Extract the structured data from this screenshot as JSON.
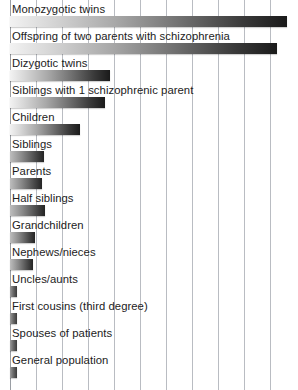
{
  "chart_data": {
    "type": "bar",
    "orientation": "horizontal",
    "title": "",
    "subtitle": "",
    "xlabel": "",
    "ylabel": "",
    "xlim": [
      0,
      50
    ],
    "grid": true,
    "legend": null,
    "gridline_step": 5,
    "gridline_count": 11,
    "categories": [
      "Monozygotic twins",
      "Offspring of two parents with schizophrenia",
      "Dizygotic twins",
      "Siblings with 1 schizophrenic parent",
      "Children",
      "Siblings",
      "Parents",
      "Half siblings",
      "Grandchildren",
      "Nephews/nieces",
      "Uncles/aunts",
      "First cousins (third degree)",
      "Spouses of patients",
      "General population"
    ],
    "values": [
      48,
      46,
      17,
      17,
      13,
      9,
      6,
      6,
      5,
      4,
      2,
      2,
      2,
      1
    ],
    "bar_pixel_lengths": [
      277,
      267,
      100,
      95,
      70,
      34,
      32,
      35,
      25,
      23,
      7,
      7,
      7,
      7
    ],
    "series": [
      {
        "name": "Risk of developing schizophrenia (%)",
        "values": [
          48,
          46,
          17,
          17,
          13,
          9,
          6,
          6,
          5,
          4,
          2,
          2,
          2,
          1
        ]
      }
    ]
  },
  "chart": {
    "bars": [
      {
        "label": "Monozygotic twins",
        "value": 48,
        "px": 277,
        "style": "long"
      },
      {
        "label": "Offspring of two parents with schizophrenia",
        "value": 46,
        "px": 267,
        "style": "long"
      },
      {
        "label": "Dizygotic twins",
        "value": 17,
        "px": 100,
        "style": "long"
      },
      {
        "label": "Siblings with 1 schizophrenic parent",
        "value": 17,
        "px": 95,
        "style": "long"
      },
      {
        "label": "Children",
        "value": 13,
        "px": 70,
        "style": "long"
      },
      {
        "label": "Siblings",
        "value": 9,
        "px": 34,
        "style": "short"
      },
      {
        "label": "Parents",
        "value": 6,
        "px": 32,
        "style": "short"
      },
      {
        "label": "Half siblings",
        "value": 6,
        "px": 35,
        "style": "short"
      },
      {
        "label": "Grandchildren",
        "value": 5,
        "px": 25,
        "style": "short"
      },
      {
        "label": "Nephews/nieces",
        "value": 4,
        "px": 23,
        "style": "short"
      },
      {
        "label": "Uncles/aunts",
        "value": 2,
        "px": 7,
        "style": "tiny"
      },
      {
        "label": "First cousins (third degree)",
        "value": 2,
        "px": 7,
        "style": "tiny"
      },
      {
        "label": "Spouses of patients",
        "value": 2,
        "px": 7,
        "style": "tiny"
      },
      {
        "label": "General population",
        "value": 1,
        "px": 7,
        "style": "tiny"
      }
    ],
    "gridline_positions_px": [
      10,
      36,
      62,
      88,
      114,
      140,
      166,
      192,
      218,
      244,
      270
    ],
    "colors": {
      "gridline": "#b9bcc2",
      "axis": "#9a9ea4",
      "bar_light": "#f2f2f2",
      "bar_dark": "#1a1a1a",
      "label_text": "#1c1c1c",
      "background": "#ffffff"
    },
    "row_height_px": 27,
    "row_top_start_px": 2
  }
}
